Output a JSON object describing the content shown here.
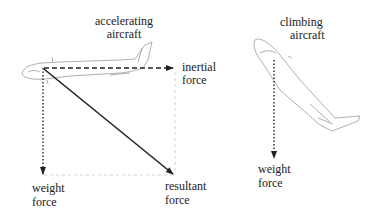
{
  "diagram": {
    "left_panel": {
      "title_line1": "accelerating",
      "title_line2": "aircraft",
      "inertial_label_line1": "inertial",
      "inertial_label_line2": "force",
      "weight_label_line1": "weight",
      "weight_label_line2": "force",
      "resultant_label_line1": "resultant",
      "resultant_label_line2": "force"
    },
    "right_panel": {
      "title_line1": "climbing",
      "title_line2": "aircraft",
      "weight_label_line1": "weight",
      "weight_label_line2": "force"
    },
    "colors": {
      "arrow": "#222222",
      "outline": "#9a9a9a",
      "guide": "#c8c8c8",
      "text": "#222222"
    }
  }
}
